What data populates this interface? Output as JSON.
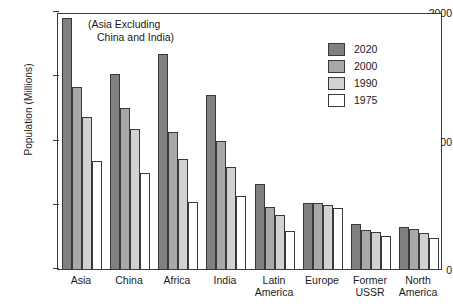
{
  "chart_data": {
    "type": "bar",
    "title": "",
    "xlabel": "",
    "ylabel": "Population (Millions)",
    "ylim": [
      0,
      2000
    ],
    "yticks": [
      "0",
      "1000",
      "2000"
    ],
    "grid": false,
    "legend_position": "top-right",
    "annotation": {
      "line1": "(Asia Excluding",
      "line2": "China and India)"
    },
    "categories": [
      "Asia",
      "China",
      "Africa",
      "India",
      "Latin\nAmerica",
      "Europe",
      "Former\nUSSR",
      "North\nAmerica"
    ],
    "category_labels": [
      {
        "line1": "Asia",
        "line2": ""
      },
      {
        "line1": "China",
        "line2": ""
      },
      {
        "line1": "Africa",
        "line2": ""
      },
      {
        "line1": "India",
        "line2": ""
      },
      {
        "line1": "Latin",
        "line2": "America"
      },
      {
        "line1": "Europe",
        "line2": ""
      },
      {
        "line1": "Former",
        "line2": "USSR"
      },
      {
        "line1": "North",
        "line2": "America"
      }
    ],
    "series": [
      {
        "name": "2020",
        "color": "#808080",
        "values": [
          1950,
          1520,
          1670,
          1355,
          660,
          515,
          350,
          330
        ]
      },
      {
        "name": "2000",
        "color": "#a8a8a8",
        "values": [
          1420,
          1250,
          1065,
          1000,
          480,
          515,
          305,
          310
        ]
      },
      {
        "name": "1990",
        "color": "#d2d2d2",
        "values": [
          1180,
          1090,
          855,
          795,
          420,
          500,
          290,
          280
        ]
      },
      {
        "name": "1975",
        "color": "#ffffff",
        "values": [
          840,
          745,
          520,
          570,
          295,
          475,
          255,
          240
        ]
      }
    ]
  },
  "legend": {
    "items": [
      {
        "label": "2020",
        "color": "#808080"
      },
      {
        "label": "2000",
        "color": "#a8a8a8"
      },
      {
        "label": "1990",
        "color": "#d2d2d2"
      },
      {
        "label": "1975",
        "color": "#ffffff"
      }
    ]
  },
  "axis": {
    "y_title": "Population (Millions)",
    "tick_2000": "2000",
    "tick_1000": "1000",
    "tick_0": "0"
  }
}
